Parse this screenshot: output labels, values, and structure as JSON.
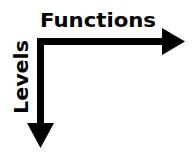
{
  "diagram": {
    "horizontal_axis": {
      "label": "Functions",
      "direction": "right"
    },
    "vertical_axis": {
      "label": "Levels",
      "direction": "down"
    },
    "colors": {
      "stroke": "#000000",
      "background": "#ffffff"
    }
  }
}
